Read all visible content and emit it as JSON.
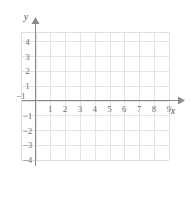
{
  "chart_data": {
    "type": "scatter",
    "title": "",
    "subtitle": "",
    "xlabel": "x",
    "ylabel": "y",
    "xlim": [
      -1,
      9.6
    ],
    "ylim": [
      -4.6,
      5.0
    ],
    "grid": true,
    "grid_color": "#e3e3e8",
    "axis_color": "#8a8a93",
    "label_color": "#6f6f77",
    "background": "#ffffff",
    "legend": null,
    "series": [],
    "annotations": [],
    "x_ticks": [
      {
        "value": -1,
        "label": "−1"
      },
      {
        "value": 1,
        "label": "1"
      },
      {
        "value": 2,
        "label": "2"
      },
      {
        "value": 3,
        "label": "3"
      },
      {
        "value": 4,
        "label": "4"
      },
      {
        "value": 5,
        "label": "5"
      },
      {
        "value": 6,
        "label": "6"
      },
      {
        "value": 7,
        "label": "7"
      },
      {
        "value": 8,
        "label": "8"
      },
      {
        "value": 9,
        "label": "9"
      }
    ],
    "y_ticks": [
      {
        "value": 4,
        "label": "4"
      },
      {
        "value": 3,
        "label": "3"
      },
      {
        "value": 2,
        "label": "2"
      },
      {
        "value": 1,
        "label": "1"
      },
      {
        "value": -1,
        "label": "−1"
      },
      {
        "value": -2,
        "label": "−2"
      },
      {
        "value": -3,
        "label": "−3"
      },
      {
        "value": -4,
        "label": "−4"
      }
    ],
    "grid_x_range": [
      -1,
      9
    ],
    "grid_y_range": [
      -4,
      4.6
    ]
  },
  "axes": {
    "x_axis_label": "x",
    "y_axis_label": "y"
  }
}
